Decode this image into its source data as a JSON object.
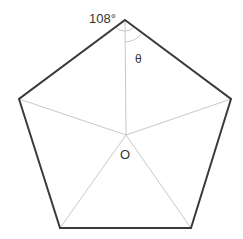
{
  "diagram": {
    "labels": {
      "angle": "108°",
      "theta": "θ",
      "center": "O"
    },
    "colors": {
      "outline": "#3a3a3a",
      "spokes": "#c8c8c8",
      "arcs": "#c8c8c8",
      "text": "#333333"
    }
  }
}
